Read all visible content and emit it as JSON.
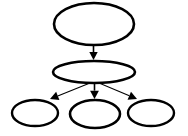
{
  "canvas": {
    "width": 188,
    "height": 136,
    "background": "#ffffff"
  },
  "diagram": {
    "type": "node-link-tree",
    "orientation": "top-down",
    "node_shape": "ellipse",
    "node_fill": "#ffffff",
    "node_stroke": "#000000",
    "node_stroke_width": 2.4,
    "edge_stroke": "#000000",
    "edge_stroke_width": 1.2,
    "arrowhead_fill": "#000000",
    "levels": 3,
    "node_count": 5,
    "edge_count": 4
  },
  "nodes": [
    {
      "id": "root",
      "label": "",
      "level": 0,
      "cx": 94,
      "cy": 24,
      "rx": 40,
      "ry": 21,
      "stroke_width": 2.6
    },
    {
      "id": "mid",
      "label": "",
      "level": 1,
      "cx": 94,
      "cy": 72,
      "rx": 41,
      "ry": 11,
      "stroke_width": 2.6
    },
    {
      "id": "leaf-left",
      "label": "",
      "level": 2,
      "cx": 35,
      "cy": 113,
      "rx": 23,
      "ry": 13,
      "stroke_width": 2.4
    },
    {
      "id": "leaf-center",
      "label": "",
      "level": 2,
      "cx": 95,
      "cy": 114,
      "rx": 25,
      "ry": 14,
      "stroke_width": 2.6
    },
    {
      "id": "leaf-right",
      "label": "",
      "level": 2,
      "cx": 151,
      "cy": 113,
      "rx": 23,
      "ry": 13,
      "stroke_width": 2.4
    }
  ],
  "edges": [
    {
      "id": "root-to-mid",
      "from": "root",
      "to": "mid",
      "label": "",
      "x1": 93.5,
      "y1": 45,
      "x2": 93.5,
      "y2": 60,
      "stroke_width": 1.6,
      "head_size": 4.2
    },
    {
      "id": "mid-to-leaf-left",
      "from": "mid",
      "to": "leaf-left",
      "label": "",
      "x1": 90,
      "y1": 83,
      "x2": 50,
      "y2": 99,
      "stroke_width": 1.1,
      "head_size": 4.4
    },
    {
      "id": "mid-to-leaf-center",
      "from": "mid",
      "to": "leaf-center",
      "label": "",
      "x1": 94.5,
      "y1": 83,
      "x2": 94.5,
      "y2": 99,
      "stroke_width": 1.6,
      "head_size": 4.4
    },
    {
      "id": "mid-to-leaf-right",
      "from": "mid",
      "to": "leaf-right",
      "label": "",
      "x1": 99,
      "y1": 83,
      "x2": 137,
      "y2": 99,
      "stroke_width": 1.1,
      "head_size": 4.4
    }
  ]
}
